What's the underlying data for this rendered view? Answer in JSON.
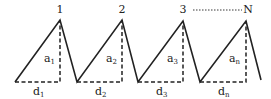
{
  "diagram": {
    "peaks": [
      {
        "label": "1",
        "height_label": "a",
        "height_sub": "1",
        "base_label": "d",
        "base_sub": "1"
      },
      {
        "label": "2",
        "height_label": "a",
        "height_sub": "2",
        "base_label": "d",
        "base_sub": "2"
      },
      {
        "label": "3",
        "height_label": "a",
        "height_sub": "3",
        "base_label": "d",
        "base_sub": "3"
      },
      {
        "label": "N",
        "height_label": "a",
        "height_sub": "n",
        "base_label": "d",
        "base_sub": "n"
      }
    ],
    "colors": {
      "line": "#222222",
      "background": "#ffffff"
    }
  }
}
